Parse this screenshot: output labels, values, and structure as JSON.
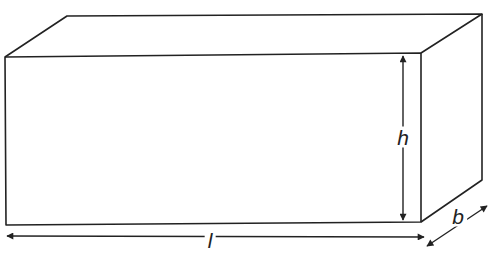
{
  "diagram": {
    "type": "cuboid-dimensions",
    "labels": {
      "height": "h",
      "length": "l",
      "breadth": "b"
    },
    "colors": {
      "stroke": "#222222",
      "background": "#ffffff"
    }
  }
}
